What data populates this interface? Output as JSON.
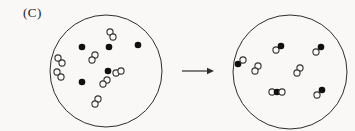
{
  "figure": {
    "label": "(C)",
    "colors": {
      "paper": "#f9f8f6",
      "outline": "#2e2e2e",
      "atom_fill": "#101010",
      "atom_stroke": "#333333"
    },
    "metrics": {
      "container_stroke_width": 1,
      "atom_radius_open": 3.1,
      "atom_radius_filled": 3.3,
      "atom_stroke_width": 1.1
    },
    "arrow": {
      "x1": 182,
      "x2": 214,
      "y": 71,
      "head_length": 7,
      "head_half_width": 3.2
    },
    "left_container": {
      "center": {
        "x": 106,
        "y": 71
      },
      "radius": 56,
      "particles": [
        {
          "kind": "atom-filled",
          "atoms": [
            {
              "x": 82,
              "y": 47,
              "type": "filled"
            }
          ]
        },
        {
          "kind": "atom-filled",
          "atoms": [
            {
              "x": 109,
              "y": 47,
              "type": "filled"
            }
          ]
        },
        {
          "kind": "atom-filled",
          "atoms": [
            {
              "x": 138,
              "y": 45,
              "type": "filled"
            }
          ]
        },
        {
          "kind": "atom-filled",
          "atoms": [
            {
              "x": 108,
              "y": 71,
              "type": "filled"
            }
          ]
        },
        {
          "kind": "atom-filled",
          "atoms": [
            {
              "x": 82,
              "y": 82,
              "type": "filled"
            }
          ]
        },
        {
          "kind": "molecule-open-open",
          "atoms": [
            {
              "x": 110,
              "y": 32,
              "type": "open"
            },
            {
              "x": 113,
              "y": 37,
              "type": "open"
            }
          ]
        },
        {
          "kind": "molecule-open-open",
          "atoms": [
            {
              "x": 58,
              "y": 58,
              "type": "open"
            },
            {
              "x": 62,
              "y": 63,
              "type": "open"
            }
          ]
        },
        {
          "kind": "molecule-open-open",
          "atoms": [
            {
              "x": 57,
              "y": 72,
              "type": "open"
            },
            {
              "x": 61,
              "y": 77,
              "type": "open"
            }
          ]
        },
        {
          "kind": "molecule-open-open",
          "atoms": [
            {
              "x": 95,
              "y": 55,
              "type": "open"
            },
            {
              "x": 92,
              "y": 60,
              "type": "open"
            }
          ]
        },
        {
          "kind": "molecule-open-open",
          "atoms": [
            {
              "x": 116,
              "y": 73,
              "type": "open"
            },
            {
              "x": 121,
              "y": 71,
              "type": "open"
            }
          ]
        },
        {
          "kind": "molecule-open-open",
          "atoms": [
            {
              "x": 107,
              "y": 80,
              "type": "open"
            },
            {
              "x": 103,
              "y": 84,
              "type": "open"
            }
          ]
        },
        {
          "kind": "molecule-open-open",
          "atoms": [
            {
              "x": 98,
              "y": 99,
              "type": "open"
            },
            {
              "x": 95,
              "y": 104,
              "type": "open"
            }
          ]
        }
      ]
    },
    "right_container": {
      "center": {
        "x": 290,
        "y": 72
      },
      "radius": 57,
      "particles": [
        {
          "kind": "molecule-open-filled",
          "atoms": [
            {
              "x": 276,
              "y": 50,
              "type": "open"
            },
            {
              "x": 281,
              "y": 46,
              "type": "filled"
            }
          ]
        },
        {
          "kind": "molecule-open-filled",
          "atoms": [
            {
              "x": 316,
              "y": 52,
              "type": "open"
            },
            {
              "x": 321,
              "y": 47,
              "type": "filled"
            }
          ]
        },
        {
          "kind": "molecule-open-filled",
          "atoms": [
            {
              "x": 238,
              "y": 64,
              "type": "filled"
            },
            {
              "x": 243,
              "y": 60,
              "type": "open"
            }
          ]
        },
        {
          "kind": "molecule-open-filled",
          "atoms": [
            {
              "x": 317,
              "y": 95,
              "type": "open"
            },
            {
              "x": 322,
              "y": 90,
              "type": "filled"
            }
          ]
        },
        {
          "kind": "molecule-open-open",
          "atoms": [
            {
              "x": 258,
              "y": 66,
              "type": "open"
            },
            {
              "x": 255,
              "y": 71,
              "type": "open"
            }
          ]
        },
        {
          "kind": "molecule-open-open",
          "atoms": [
            {
              "x": 300,
              "y": 68,
              "type": "open"
            },
            {
              "x": 297,
              "y": 73,
              "type": "open"
            }
          ]
        },
        {
          "kind": "molecule-open-filled-open",
          "atoms": [
            {
              "x": 272,
              "y": 92,
              "type": "open"
            },
            {
              "x": 277,
              "y": 92,
              "type": "filled"
            },
            {
              "x": 282,
              "y": 92,
              "type": "open"
            }
          ]
        }
      ]
    }
  }
}
